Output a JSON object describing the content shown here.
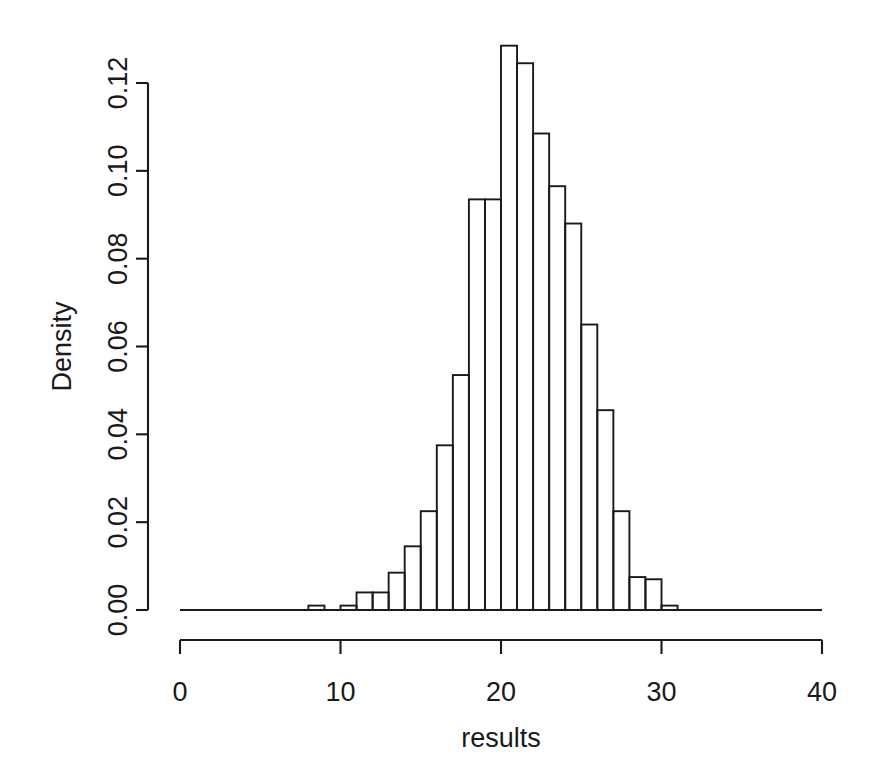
{
  "chart_data": {
    "type": "bar",
    "title": "",
    "subtitle": "",
    "xlabel": "results",
    "ylabel": "Density",
    "xlim": [
      0,
      40
    ],
    "ylim": [
      0.0,
      0.13
    ],
    "grid": false,
    "legend": null,
    "annotations": [],
    "bin_width": 1,
    "x_ticks": [
      {
        "value": 0,
        "label": "0"
      },
      {
        "value": 10,
        "label": "10"
      },
      {
        "value": 20,
        "label": "20"
      },
      {
        "value": 30,
        "label": "30"
      },
      {
        "value": 40,
        "label": "40"
      }
    ],
    "y_ticks": [
      {
        "value": 0.0,
        "label": "0.00"
      },
      {
        "value": 0.02,
        "label": "0.02"
      },
      {
        "value": 0.04,
        "label": "0.04"
      },
      {
        "value": 0.06,
        "label": "0.06"
      },
      {
        "value": 0.08,
        "label": "0.08"
      },
      {
        "value": 0.1,
        "label": "0.10"
      },
      {
        "value": 0.12,
        "label": "0.12"
      }
    ],
    "bins": [
      {
        "left": 8,
        "right": 9,
        "density": 0.001
      },
      {
        "left": 9,
        "right": 10,
        "density": 0.0
      },
      {
        "left": 10,
        "right": 11,
        "density": 0.001
      },
      {
        "left": 11,
        "right": 12,
        "density": 0.004
      },
      {
        "left": 12,
        "right": 13,
        "density": 0.004
      },
      {
        "left": 13,
        "right": 14,
        "density": 0.0085
      },
      {
        "left": 14,
        "right": 15,
        "density": 0.0145
      },
      {
        "left": 15,
        "right": 16,
        "density": 0.0225
      },
      {
        "left": 16,
        "right": 17,
        "density": 0.0375
      },
      {
        "left": 17,
        "right": 18,
        "density": 0.0535
      },
      {
        "left": 18,
        "right": 19,
        "density": 0.0935
      },
      {
        "left": 19,
        "right": 20,
        "density": 0.0935
      },
      {
        "left": 20,
        "right": 21,
        "density": 0.1285
      },
      {
        "left": 21,
        "right": 22,
        "density": 0.1245
      },
      {
        "left": 22,
        "right": 23,
        "density": 0.1085
      },
      {
        "left": 23,
        "right": 24,
        "density": 0.0965
      },
      {
        "left": 24,
        "right": 25,
        "density": 0.088
      },
      {
        "left": 25,
        "right": 26,
        "density": 0.065
      },
      {
        "left": 26,
        "right": 27,
        "density": 0.0455
      },
      {
        "left": 27,
        "right": 28,
        "density": 0.0225
      },
      {
        "left": 28,
        "right": 29,
        "density": 0.0075
      },
      {
        "left": 29,
        "right": 30,
        "density": 0.007
      },
      {
        "left": 30,
        "right": 31,
        "density": 0.001
      }
    ],
    "x_axis_domain": [
      0,
      40
    ],
    "y_axis_domain": [
      0.0,
      0.12
    ],
    "colors": {
      "bar_stroke": "#1a1a1a",
      "bar_fill": "none",
      "axis": "#1a1a1a",
      "background": "#ffffff"
    }
  },
  "layout": {
    "plot_left_px": 180,
    "plot_right_px": 822,
    "baseline_y_px": 610,
    "y_top_px": 83,
    "y_axis_x_px": 148,
    "x_axis_y_px": 640,
    "x_tick_label_y_px": 682,
    "xlabel_y_px": 738,
    "ylabel_x_px": 62
  }
}
